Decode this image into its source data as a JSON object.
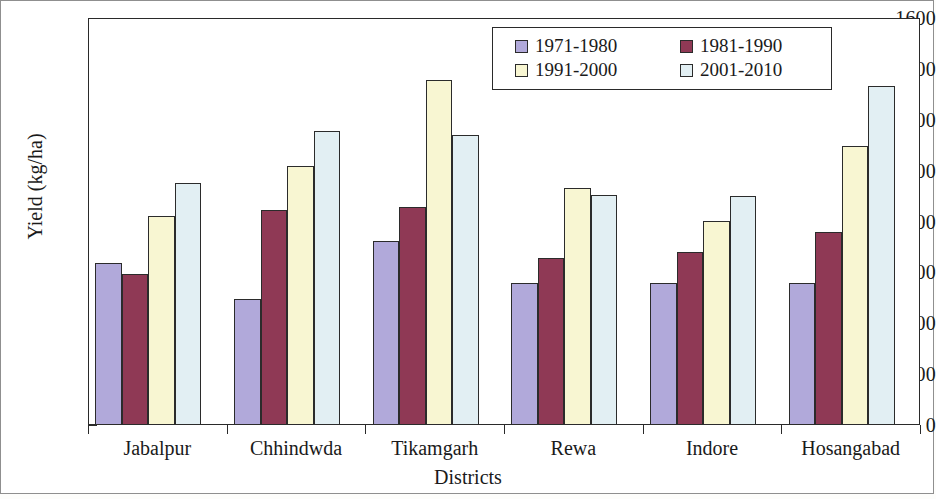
{
  "chart_data": {
    "type": "bar",
    "title": "",
    "subtitle": "",
    "xlabel": "Districts",
    "ylabel": "Yield (kg/ha)",
    "ylim": [
      0,
      1600
    ],
    "ytick_step": 200,
    "yticks": [
      "1600",
      "1400",
      "1200",
      "1000",
      "800",
      "600",
      "400",
      "200",
      "0"
    ],
    "grid": false,
    "legend_position": "top-right-inside",
    "categories": [
      "Jabalpur",
      "Chhindwda",
      "Tikamgarh",
      "Rewa",
      "Indore",
      "Hosangabad"
    ],
    "series": [
      {
        "name": "1971-1980",
        "color": "#b1a9da",
        "values": [
          635,
          495,
          722,
          560,
          560,
          560
        ]
      },
      {
        "name": "1981-1990",
        "color": "#8f3955",
        "values": [
          595,
          845,
          858,
          655,
          682,
          760
        ]
      },
      {
        "name": "1991-2000",
        "color": "#f8f6d2",
        "values": [
          820,
          1020,
          1355,
          932,
          802,
          1098
        ]
      },
      {
        "name": "2001-2010",
        "color": "#e2eff3",
        "values": [
          952,
          1155,
          1140,
          905,
          900,
          1332
        ]
      }
    ]
  },
  "axis_title_y": "Yield (kg/ha)",
  "axis_title_x": "Districts"
}
